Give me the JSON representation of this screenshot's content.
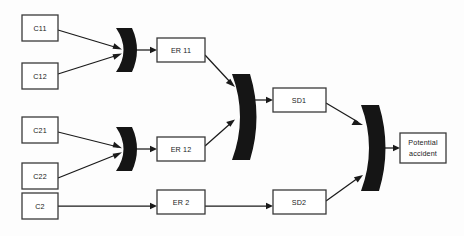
{
  "diagram": {
    "background_color": "#fdfdfd",
    "node_fill": "#ffffff",
    "node_stroke": "#3a3a3a",
    "gate_color": "#151515",
    "edge_color": "#1a1a1a",
    "nodes": [
      {
        "id": "c11",
        "label": "C11",
        "x": 22,
        "y": 15,
        "w": 36,
        "h": 26
      },
      {
        "id": "c12",
        "label": "C12",
        "x": 22,
        "y": 63,
        "w": 36,
        "h": 26
      },
      {
        "id": "c21",
        "label": "C21",
        "x": 22,
        "y": 117,
        "w": 36,
        "h": 26
      },
      {
        "id": "c22",
        "label": "C22",
        "x": 22,
        "y": 163,
        "w": 36,
        "h": 26
      },
      {
        "id": "c2",
        "label": "C2",
        "x": 22,
        "y": 193,
        "w": 36,
        "h": 26
      },
      {
        "id": "er11",
        "label": "ER 11",
        "x": 157,
        "y": 38,
        "w": 48,
        "h": 24
      },
      {
        "id": "er12",
        "label": "ER 12",
        "x": 157,
        "y": 137,
        "w": 48,
        "h": 24
      },
      {
        "id": "er2",
        "label": "ER 2",
        "x": 157,
        "y": 190,
        "w": 48,
        "h": 24
      },
      {
        "id": "sd1",
        "label": "SD1",
        "x": 273,
        "y": 88,
        "w": 53,
        "h": 24
      },
      {
        "id": "sd2",
        "label": "SD2",
        "x": 273,
        "y": 190,
        "w": 53,
        "h": 24
      },
      {
        "id": "pa",
        "label_line1": "Potential",
        "label_line2": "accident",
        "x": 400,
        "y": 133,
        "w": 46,
        "h": 30
      }
    ],
    "gates": [
      {
        "id": "gate-1",
        "cx": 127,
        "cy": 50,
        "height": 44,
        "thickness": 13
      },
      {
        "id": "gate-2",
        "cx": 127,
        "cy": 149,
        "height": 44,
        "thickness": 13
      },
      {
        "id": "gate-center",
        "cx": 242,
        "cy": 117,
        "height": 85,
        "thickness": 16
      },
      {
        "id": "gate-final",
        "cx": 371,
        "cy": 148,
        "height": 85,
        "thickness": 16
      }
    ],
    "edges": [
      {
        "id": "e-c11-gate1",
        "from": "c11",
        "to": "gate-1"
      },
      {
        "id": "e-c12-gate1",
        "from": "c12",
        "to": "gate-1"
      },
      {
        "id": "e-gate1-er11",
        "from": "gate-1",
        "to": "er11"
      },
      {
        "id": "e-c21-gate2",
        "from": "c21",
        "to": "gate-2"
      },
      {
        "id": "e-c22-gate2",
        "from": "c22",
        "to": "gate-2"
      },
      {
        "id": "e-gate2-er12",
        "from": "gate-2",
        "to": "er12"
      },
      {
        "id": "e-er11-gatec",
        "from": "er11",
        "to": "gate-center"
      },
      {
        "id": "e-er12-gatec",
        "from": "er12",
        "to": "gate-center"
      },
      {
        "id": "e-gatec-sd1",
        "from": "gate-center",
        "to": "sd1"
      },
      {
        "id": "e-c2-er2",
        "from": "c2",
        "to": "er2"
      },
      {
        "id": "e-er2-sd2",
        "from": "er2",
        "to": "sd2"
      },
      {
        "id": "e-sd1-gatef",
        "from": "sd1",
        "to": "gate-final"
      },
      {
        "id": "e-sd2-gatef",
        "from": "sd2",
        "to": "gate-final"
      },
      {
        "id": "e-gatef-pa",
        "from": "gate-final",
        "to": "pa"
      }
    ]
  }
}
